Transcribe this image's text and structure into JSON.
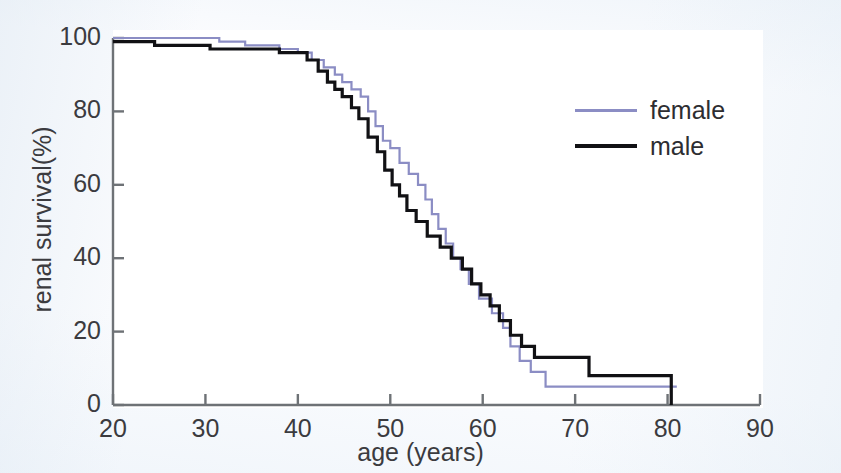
{
  "chart_data": {
    "type": "line",
    "subtype": "kaplan-meier-step",
    "title": "",
    "xlabel": "age (years)",
    "ylabel": "renal survival(%)",
    "xlim": [
      20,
      90
    ],
    "ylim": [
      0,
      100
    ],
    "xticks": [
      20,
      30,
      40,
      50,
      60,
      70,
      80,
      90
    ],
    "yticks": [
      0,
      20,
      40,
      60,
      80,
      100
    ],
    "xtick_labels": [
      "20",
      "30",
      "40",
      "50",
      "60",
      "70",
      "80",
      "90"
    ],
    "ytick_labels": [
      "0",
      "20",
      "40",
      "60",
      "80",
      "100"
    ],
    "grid": false,
    "legend_position": "upper right",
    "series": [
      {
        "name": "female",
        "color": "#8b8dc4",
        "line_width": 2.2,
        "points": [
          [
            20.0,
            100
          ],
          [
            31.5,
            100
          ],
          [
            31.5,
            99
          ],
          [
            34.3,
            99
          ],
          [
            34.3,
            98
          ],
          [
            38.0,
            98
          ],
          [
            38.0,
            97
          ],
          [
            40.0,
            97
          ],
          [
            40.0,
            96
          ],
          [
            41.5,
            96
          ],
          [
            41.5,
            94
          ],
          [
            42.8,
            94
          ],
          [
            42.8,
            92
          ],
          [
            44.0,
            92
          ],
          [
            44.0,
            90
          ],
          [
            44.8,
            90
          ],
          [
            44.8,
            88
          ],
          [
            45.8,
            88
          ],
          [
            45.8,
            86
          ],
          [
            46.8,
            86
          ],
          [
            46.8,
            84
          ],
          [
            47.6,
            84
          ],
          [
            47.6,
            80
          ],
          [
            48.4,
            80
          ],
          [
            48.4,
            76
          ],
          [
            49.2,
            76
          ],
          [
            49.2,
            72
          ],
          [
            50.0,
            72
          ],
          [
            50.0,
            70
          ],
          [
            51.0,
            70
          ],
          [
            51.0,
            66
          ],
          [
            52.0,
            66
          ],
          [
            52.0,
            63
          ],
          [
            53.0,
            63
          ],
          [
            53.0,
            60
          ],
          [
            53.8,
            60
          ],
          [
            53.8,
            56
          ],
          [
            54.5,
            56
          ],
          [
            54.5,
            52
          ],
          [
            55.2,
            52
          ],
          [
            55.2,
            48
          ],
          [
            56.0,
            48
          ],
          [
            56.0,
            44
          ],
          [
            56.8,
            44
          ],
          [
            56.8,
            40
          ],
          [
            57.6,
            40
          ],
          [
            57.6,
            37
          ],
          [
            58.5,
            37
          ],
          [
            58.5,
            33
          ],
          [
            59.6,
            33
          ],
          [
            59.6,
            29
          ],
          [
            61.0,
            29
          ],
          [
            61.0,
            25
          ],
          [
            62.2,
            25
          ],
          [
            62.2,
            21
          ],
          [
            63.0,
            21
          ],
          [
            63.0,
            16
          ],
          [
            64.0,
            16
          ],
          [
            64.0,
            12
          ],
          [
            65.2,
            12
          ],
          [
            65.2,
            9
          ],
          [
            66.8,
            9
          ],
          [
            66.8,
            5
          ],
          [
            81.0,
            5
          ]
        ]
      },
      {
        "name": "male",
        "color": "#111114",
        "line_width": 3.2,
        "points": [
          [
            20.0,
            99
          ],
          [
            24.5,
            99
          ],
          [
            24.5,
            98
          ],
          [
            30.5,
            98
          ],
          [
            30.5,
            97
          ],
          [
            38.0,
            97
          ],
          [
            38.0,
            96
          ],
          [
            41.0,
            96
          ],
          [
            41.0,
            94
          ],
          [
            42.2,
            94
          ],
          [
            42.2,
            91
          ],
          [
            43.2,
            91
          ],
          [
            43.2,
            88
          ],
          [
            44.0,
            88
          ],
          [
            44.0,
            86
          ],
          [
            44.8,
            86
          ],
          [
            44.8,
            84
          ],
          [
            45.8,
            84
          ],
          [
            45.8,
            81
          ],
          [
            46.6,
            81
          ],
          [
            46.6,
            78
          ],
          [
            47.6,
            78
          ],
          [
            47.6,
            73
          ],
          [
            48.6,
            73
          ],
          [
            48.6,
            69
          ],
          [
            49.4,
            69
          ],
          [
            49.4,
            64
          ],
          [
            50.2,
            64
          ],
          [
            50.2,
            60
          ],
          [
            51.0,
            60
          ],
          [
            51.0,
            57
          ],
          [
            51.8,
            57
          ],
          [
            51.8,
            53
          ],
          [
            52.8,
            53
          ],
          [
            52.8,
            50
          ],
          [
            54.0,
            50
          ],
          [
            54.0,
            46
          ],
          [
            55.4,
            46
          ],
          [
            55.4,
            43
          ],
          [
            56.6,
            43
          ],
          [
            56.6,
            40
          ],
          [
            57.8,
            40
          ],
          [
            57.8,
            37
          ],
          [
            58.8,
            37
          ],
          [
            58.8,
            33
          ],
          [
            59.8,
            33
          ],
          [
            59.8,
            30
          ],
          [
            60.8,
            30
          ],
          [
            60.8,
            27
          ],
          [
            61.8,
            27
          ],
          [
            61.8,
            23
          ],
          [
            63.0,
            23
          ],
          [
            63.0,
            19
          ],
          [
            64.2,
            19
          ],
          [
            64.2,
            16
          ],
          [
            65.6,
            16
          ],
          [
            65.6,
            13
          ],
          [
            71.5,
            13
          ],
          [
            71.5,
            8
          ],
          [
            80.4,
            8
          ],
          [
            80.4,
            0
          ]
        ]
      }
    ]
  },
  "axes": {
    "x_title": "age (years)",
    "y_title": "renal survival(%)"
  },
  "legend": {
    "entries": [
      {
        "label": "female",
        "color": "#8b8dc4"
      },
      {
        "label": "male",
        "color": "#111114"
      }
    ]
  },
  "colors": {
    "female": "#8b8dc4",
    "male": "#111114",
    "axis": "#6e7276",
    "text": "#3b3b3f",
    "background": "#fbfcfe",
    "plot_background": "#ffffff"
  }
}
